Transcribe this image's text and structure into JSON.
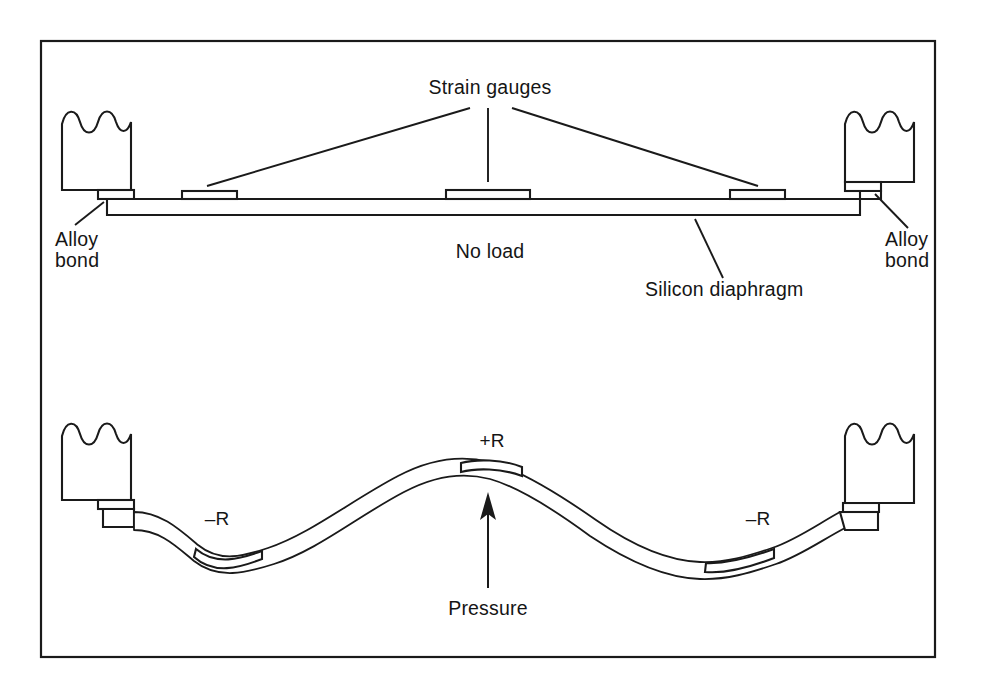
{
  "figure": {
    "border_color": "#1a1a1a",
    "line_color": "#1a1a1a",
    "background_color": "#ffffff"
  },
  "labels": {
    "strain_gauges": "Strain gauges",
    "alloy_bond_left_line1": "Alloy",
    "alloy_bond_left_line2": "bond",
    "alloy_bond_right_line1": "Alloy",
    "alloy_bond_right_line2": "bond",
    "no_load": "No load",
    "silicon_diaphragm": "Silicon diaphragm",
    "gauge_plus_r": "+R",
    "gauge_minus_r_left": "–R",
    "gauge_minus_r_right": "–R",
    "pressure": "Pressure"
  },
  "panels": [
    {
      "name": "no-load-panel",
      "state_label": "No load",
      "description": "Flat silicon diaphragm supported at both ends by alloy-bonded blocks, with three strain gauges on the top surface",
      "gauge_count": 3
    },
    {
      "name": "pressure-panel",
      "state_label": "Pressure",
      "description": "Deflected S-curved silicon diaphragm under applied pressure from below, with one tensile gauge at the crest and two compressive gauges in the troughs",
      "gauge_count": 3,
      "gauge_signs": [
        "–R",
        "+R",
        "–R"
      ]
    }
  ],
  "icons": {
    "pressure_arrow": "up-arrow-icon",
    "break_symbol": "wavy-break-icon"
  }
}
